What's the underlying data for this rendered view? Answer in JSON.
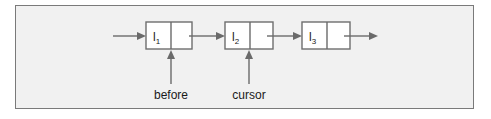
{
  "diagram": {
    "type": "linked-list",
    "nodes": [
      {
        "label": "l",
        "subscript": "1"
      },
      {
        "label": "l",
        "subscript": "2"
      },
      {
        "label": "l",
        "subscript": "3"
      }
    ],
    "pointers": [
      {
        "label": "before",
        "target_node": 1
      },
      {
        "label": "cursor",
        "target_node": 2
      }
    ],
    "colors": {
      "frame_border": "#7a7a7a",
      "frame_background": "#f1f1f1",
      "node_fill": "#ffffff",
      "arrow": "#6a6a6a",
      "text": "#1a1a1a"
    }
  }
}
